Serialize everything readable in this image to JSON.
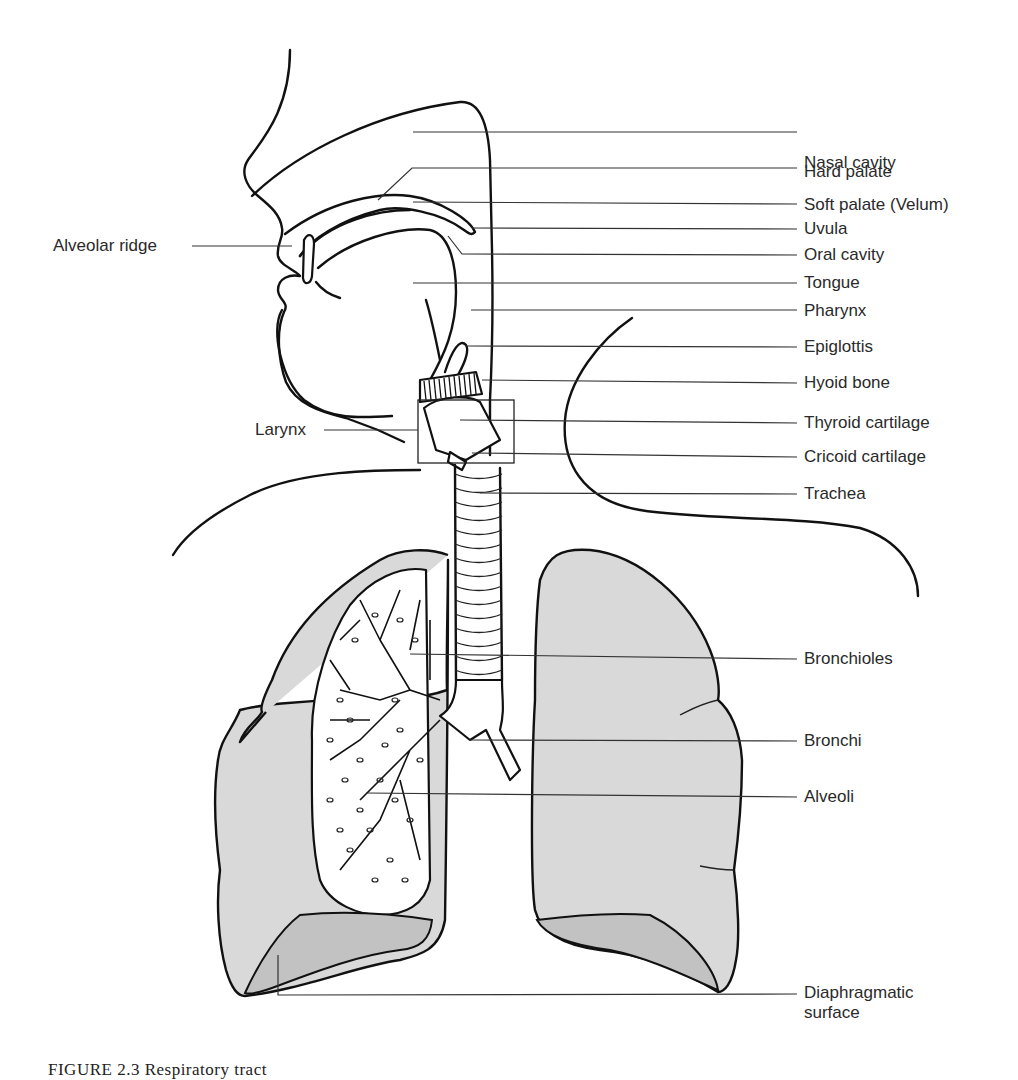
{
  "figure": {
    "caption": "FIGURE 2.3   Respiratory tract (from Ve...",
    "colors": {
      "line": "#111111",
      "lung_fill": "#d9d9d9",
      "diaphragm_fill": "#c2c2c2",
      "background": "#ffffff",
      "label_text": "#2a2a2a"
    }
  },
  "labels_right": [
    {
      "id": "nasal-cavity",
      "text": "Nasal cavity",
      "y": 163
    },
    {
      "id": "hard-palate",
      "text": "Hard palate",
      "y": 172
    },
    {
      "id": "soft-palate",
      "text": "Soft palate (Velum)",
      "y": 205
    },
    {
      "id": "uvula",
      "text": "Uvula",
      "y": 229
    },
    {
      "id": "oral-cavity",
      "text": "Oral cavity",
      "y": 255
    },
    {
      "id": "tongue",
      "text": "Tongue",
      "y": 283
    },
    {
      "id": "pharynx",
      "text": "Pharynx",
      "y": 311
    },
    {
      "id": "epiglottis",
      "text": "Epiglottis",
      "y": 347
    },
    {
      "id": "hyoid-bone",
      "text": "Hyoid bone",
      "y": 383
    },
    {
      "id": "thyroid-cartilage",
      "text": "Thyroid cartilage",
      "y": 423
    },
    {
      "id": "cricoid-cartilage",
      "text": "Cricoid cartilage",
      "y": 457
    },
    {
      "id": "trachea",
      "text": "Trachea",
      "y": 494
    },
    {
      "id": "bronchioles",
      "text": "Bronchioles",
      "y": 659
    },
    {
      "id": "bronchi",
      "text": "Bronchi",
      "y": 741
    },
    {
      "id": "alveoli",
      "text": "Alveoli",
      "y": 797
    },
    {
      "id": "diaphragmatic-surface",
      "text": "Diaphragmatic\nsurface",
      "y": 993
    }
  ],
  "labels_left": [
    {
      "id": "alveolar-ridge",
      "text": "Alveolar ridge",
      "y": 246
    },
    {
      "id": "larynx",
      "text": "Larynx",
      "y": 430
    }
  ],
  "text": {
    "nasal_cavity": "Nasal cavity",
    "hard_palate": "Hard palate",
    "soft_palate": "Soft palate (Velum)",
    "uvula": "Uvula",
    "oral_cavity": "Oral cavity",
    "tongue": "Tongue",
    "pharynx": "Pharynx",
    "epiglottis": "Epiglottis",
    "hyoid_bone": "Hyoid bone",
    "thyroid_cartilage": "Thyroid cartilage",
    "cricoid_cartilage": "Cricoid cartilage",
    "trachea": "Trachea",
    "bronchioles": "Bronchioles",
    "bronchi": "Bronchi",
    "alveoli": "Alveoli",
    "diaphragmatic_1": "Diaphragmatic",
    "diaphragmatic_2": "surface",
    "alveolar_ridge": "Alveolar ridge",
    "larynx": "Larynx",
    "caption": "FIGURE 2.3   Respiratory tract"
  }
}
